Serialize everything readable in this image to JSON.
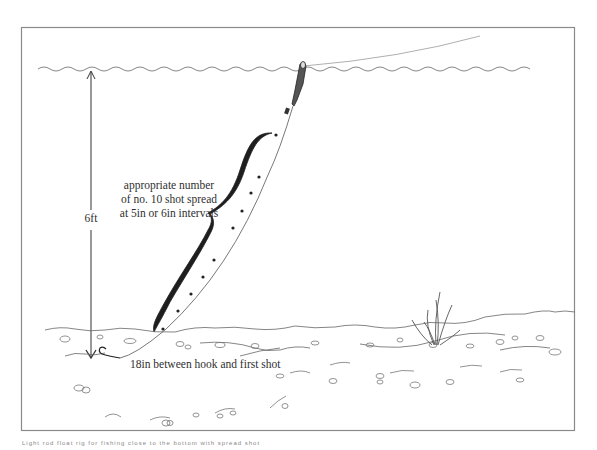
{
  "diagram": {
    "labels": {
      "shot_spread": [
        "appropriate number",
        "of no. 10 shot spread",
        "at 5in or 6in intervals"
      ],
      "depth": "6ft",
      "hook_distance": "18in between hook and first shot"
    },
    "caption": "Light rod float rig for fishing close to the bottom with spread shot",
    "elements": [
      {
        "name": "water-surface",
        "style": "wavy line"
      },
      {
        "name": "fishing-line",
        "style": "curved line above surface"
      },
      {
        "name": "float",
        "style": "quill float at surface"
      },
      {
        "name": "depth-arrow",
        "value": "6ft"
      },
      {
        "name": "shot-bracket",
        "style": "curly brace"
      },
      {
        "name": "split-shot",
        "count": 9
      },
      {
        "name": "hook",
        "position": "near bottom"
      },
      {
        "name": "riverbed",
        "style": "wavy line with pebbles"
      },
      {
        "name": "weed-plant",
        "position": "right side on bottom"
      }
    ],
    "colors": {
      "line": "#3a3a3a",
      "frame": "#8a8a8a",
      "ink": "#1e1e1e"
    }
  }
}
